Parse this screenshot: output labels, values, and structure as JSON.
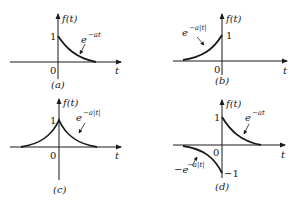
{
  "panels": [
    {
      "id": "a",
      "caption": "(a)",
      "y_axis_label": "f(t)",
      "x_axis_label": "t",
      "origin_label": "0",
      "tick_labels": [
        "1"
      ],
      "curve_label_base": "e",
      "curve_label_exp": "−at",
      "description": "decaying exponential for t > 0, starting at 1"
    },
    {
      "id": "b",
      "caption": "(b)",
      "y_axis_label": "f(t)",
      "x_axis_label": "t",
      "origin_label": "0",
      "tick_labels": [
        "1"
      ],
      "curve_label_base": "e",
      "curve_label_exp": "−a|t|",
      "description": "rising exponential for t < 0, reaching 1 at t = 0"
    },
    {
      "id": "c",
      "caption": "(c)",
      "y_axis_label": "f(t)",
      "x_axis_label": "t",
      "origin_label": "0",
      "tick_labels": [
        "1"
      ],
      "curve_label_base": "e",
      "curve_label_exp": "−a|t|",
      "description": "two-sided symmetric exponential peaking at 1 at t = 0"
    },
    {
      "id": "d",
      "caption": "(d)",
      "y_axis_label": "f(t)",
      "x_axis_label": "t",
      "origin_label": "0",
      "tick_labels": [
        "1",
        "−1"
      ],
      "curve_label_base": "e",
      "curve_label_exp": "−at",
      "curve2_label_prefix": "−e",
      "curve2_label_exp": "−a|t|",
      "description": "odd exponential: e^{-at} for t > 0, −e^{-a|t|} for t < 0"
    }
  ]
}
